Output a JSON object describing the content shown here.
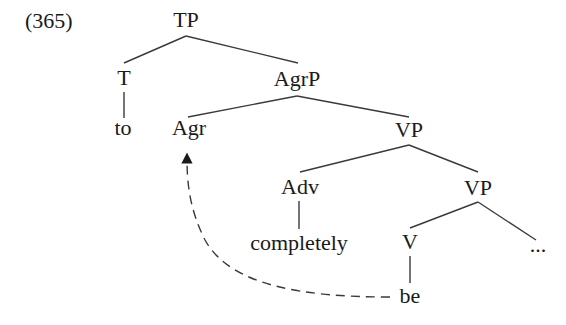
{
  "example_number": "(365)",
  "tree": {
    "nodes": {
      "TP": "TP",
      "T": "T",
      "to": "to",
      "AgrP": "AgrP",
      "Agr": "Agr",
      "VP_outer": "VP",
      "Adv": "Adv",
      "completely": "completely",
      "VP_inner": "VP",
      "V": "V",
      "ellipsis": "...",
      "be": "be"
    },
    "edges": [
      [
        "TP",
        "T"
      ],
      [
        "TP",
        "AgrP"
      ],
      [
        "T",
        "to"
      ],
      [
        "AgrP",
        "Agr"
      ],
      [
        "AgrP",
        "VP_outer"
      ],
      [
        "VP_outer",
        "Adv"
      ],
      [
        "VP_outer",
        "VP_inner"
      ],
      [
        "Adv",
        "completely"
      ],
      [
        "VP_inner",
        "V"
      ],
      [
        "VP_inner",
        "ellipsis"
      ],
      [
        "V",
        "be"
      ]
    ],
    "movement_arrow": {
      "from": "be",
      "to": "Agr",
      "style": "dashed"
    }
  }
}
